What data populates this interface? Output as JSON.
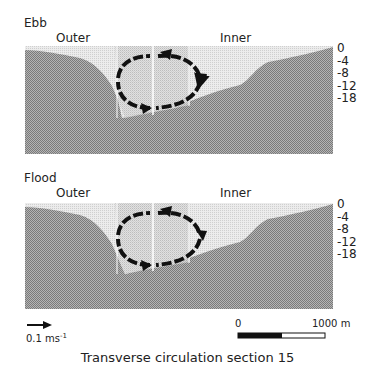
{
  "figure": {
    "caption": "Transverse circulation section 15",
    "panels": [
      {
        "title": "Ebb",
        "left_label": "Outer",
        "right_label": "Inner",
        "depth_ticks": [
          "0",
          "-4",
          "-8",
          "-12",
          "-18"
        ]
      },
      {
        "title": "Flood",
        "left_label": "Outer",
        "right_label": "Inner",
        "depth_ticks": [
          "0",
          "-4",
          "-8",
          "-12",
          "-18"
        ]
      }
    ],
    "velocity_legend": {
      "value": "0.1 ms",
      "exponent": "-1",
      "icon": "arrow-right-icon"
    },
    "scale_bar": {
      "start_label": "0",
      "end_label": "1000 m"
    },
    "colors": {
      "bed": "#9a9a9a",
      "water": "#dcdcdc",
      "channel": "#c8c8c8",
      "arrows": "#111111"
    }
  }
}
